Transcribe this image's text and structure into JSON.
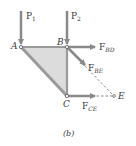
{
  "figure": {
    "caption": "(b)",
    "colors": {
      "arrow": "#8a8a8a",
      "member": "#9a9a9a",
      "fill": "#d8d8d8",
      "dashed": "#6a6a6a",
      "text": "#3a3a3a"
    },
    "nodes": {
      "A": {
        "label": "A"
      },
      "B": {
        "label": "B"
      },
      "C": {
        "label": "C"
      },
      "E": {
        "label": "E"
      }
    },
    "forces": {
      "P1": {
        "main": "P",
        "sub": "1"
      },
      "P2": {
        "main": "P",
        "sub": "2"
      },
      "FBD": {
        "main": "F",
        "sub": "BD"
      },
      "FBE": {
        "main": "F",
        "sub": "BE"
      },
      "FCE": {
        "main": "F",
        "sub": "CE"
      }
    }
  }
}
